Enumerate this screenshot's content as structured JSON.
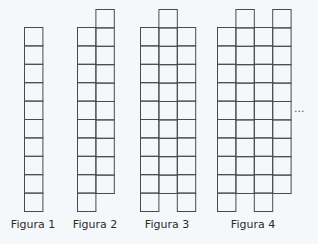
{
  "square_size": 18.4,
  "stroke_color": "#4a4a4a",
  "background": "#f5f8fb",
  "figures": [
    {
      "label": "Figura 1",
      "label_x": 33,
      "origin_x": 24,
      "columns": [
        {
          "top": 27,
          "bottom": 211
        }
      ]
    },
    {
      "label": "Figura 2",
      "label_x": 95,
      "origin_x": 77,
      "columns": [
        {
          "top": 27,
          "bottom": 211
        },
        {
          "top": 9,
          "bottom": 192
        }
      ]
    },
    {
      "label": "Figura 3",
      "label_x": 167,
      "origin_x": 140,
      "columns": [
        {
          "top": 27,
          "bottom": 211
        },
        {
          "top": 9,
          "bottom": 192
        },
        {
          "top": 27,
          "bottom": 211
        }
      ]
    },
    {
      "label": "Figura 4",
      "label_x": 253,
      "origin_x": 217,
      "columns": [
        {
          "top": 27,
          "bottom": 211
        },
        {
          "top": 9,
          "bottom": 192
        },
        {
          "top": 27,
          "bottom": 211
        },
        {
          "top": 9,
          "bottom": 192
        }
      ]
    }
  ],
  "continuation": "..."
}
